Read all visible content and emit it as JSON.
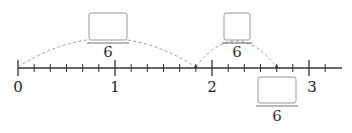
{
  "number_line": {
    "min": 0,
    "max": 3,
    "subdivisions_per_unit": 6,
    "labels": [
      "0",
      "1",
      "2",
      "3"
    ],
    "axis_color": "#333333"
  },
  "jumps": [
    {
      "from": "0",
      "to": "11/6",
      "label_numerator": "",
      "label_denominator": "6"
    },
    {
      "from": "11/6",
      "to": "16/6",
      "label_numerator": "",
      "label_denominator": "6"
    }
  ],
  "answer_box": {
    "numerator": "",
    "denominator": "6"
  },
  "colors": {
    "box_border": "#999999",
    "arc": "#9a9a9a"
  }
}
